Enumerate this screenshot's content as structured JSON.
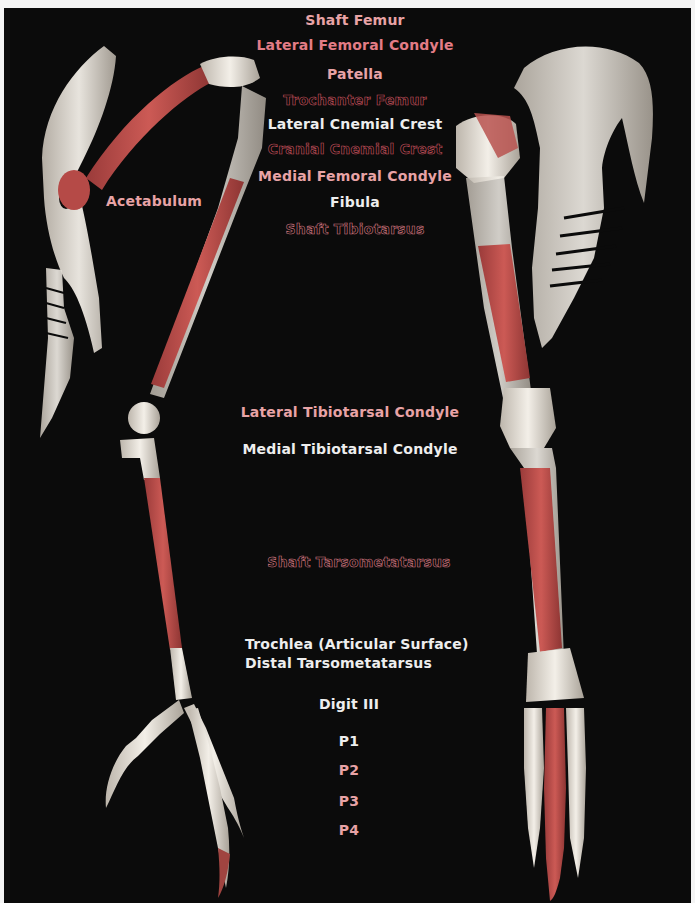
{
  "figure": {
    "colors": {
      "background": "#0b0b0b",
      "bone": "#e9e4dc",
      "highlight_shaft": "#c0504d",
      "label_white": "#eeeeee",
      "label_pink": "#e8a3a6",
      "label_rose": "#e37c86",
      "label_outline": "#d47780"
    }
  },
  "labels": {
    "shaft_femur": "Shaft Femur",
    "lateral_femoral_condyle": "Lateral Femoral Condyle",
    "patella": "Patella",
    "trochanter_femur": "Trochanter Femur",
    "lateral_cnemial_crest": "Lateral Cnemial Crest",
    "cranial_cnemial_crest": "Cranial Cnemial Crest",
    "medial_femoral_condyle": "Medial Femoral Condyle",
    "fibula": "Fibula",
    "shaft_tibiotarsus": "Shaft Tibiotarsus",
    "acetabulum": "Acetabulum",
    "lateral_tibiotarsal_condyle": "Lateral Tibiotarsal Condyle",
    "medial_tibiotarsal_condyle": "Medial Tibiotarsal Condyle",
    "shaft_tarsometatarsus": "Shaft Tarsometatarsus",
    "trochlea": "Trochlea (Articular Surface)",
    "distal_tarsometatarsus": "Distal Tarsometatarsus",
    "digit_iii": "Digit III",
    "p1": "P1",
    "p2": "P2",
    "p3": "P3",
    "p4": "P4"
  }
}
